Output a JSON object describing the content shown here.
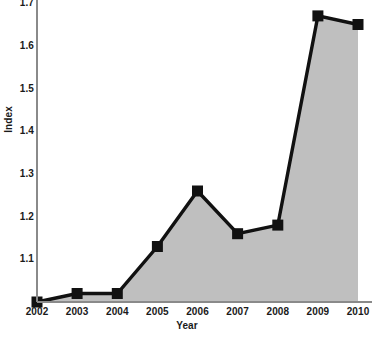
{
  "chart_data": {
    "type": "area",
    "title": "",
    "xlabel": "Year",
    "ylabel": "Index",
    "categories": [
      "2002",
      "2003",
      "2004",
      "2005",
      "2006",
      "2007",
      "2008",
      "2009",
      "2010"
    ],
    "values": [
      1.0,
      1.02,
      1.02,
      1.13,
      1.26,
      1.16,
      1.18,
      1.67,
      1.65
    ],
    "series": [
      {
        "name": "Index",
        "values": [
          1.0,
          1.02,
          1.02,
          1.13,
          1.26,
          1.16,
          1.18,
          1.67,
          1.65
        ]
      }
    ],
    "x": [
      2002,
      2003,
      2004,
      2005,
      2006,
      2007,
      2008,
      2009,
      2010
    ],
    "ylim": [
      1.0,
      1.7
    ],
    "xlim": [
      2002,
      2010
    ],
    "yticks": [
      "1.7",
      "1.6",
      "1.5",
      "1.4",
      "1.3",
      "1.2",
      "1.1"
    ],
    "ytick_values": [
      1.7,
      1.6,
      1.5,
      1.4,
      1.3,
      1.2,
      1.1
    ],
    "xticks": [
      "2002",
      "2003",
      "2004",
      "2005",
      "2006",
      "2007",
      "2008",
      "2009",
      "2010"
    ],
    "grid": false,
    "legend": false,
    "legend_position": "none",
    "line_color": "#111111",
    "marker_color": "#111111",
    "fill_color": "#bfbfbf",
    "axis_color": "#777777",
    "background_color": "#ffffff",
    "marker_shape": "square"
  },
  "axes": {
    "y_title": "Index",
    "x_title": "Year"
  }
}
